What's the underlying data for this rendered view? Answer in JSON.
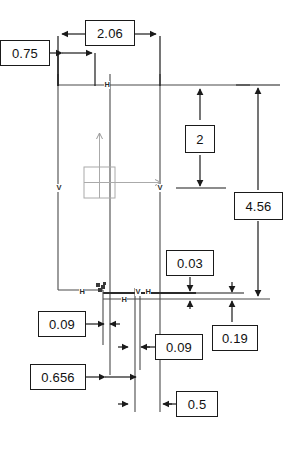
{
  "drawing": {
    "type": "cad-sketch-dimension-view",
    "background_color": "#ffffff",
    "line_color": "#3a3a3a",
    "dimension_line_color": "#1a1a1a",
    "box_border_color": "#1a1a1a",
    "origin_marker_color": "#9a9a9a"
  },
  "dimensions": [
    {
      "id": "d-075",
      "value": "0.75",
      "orientation": "horizontal",
      "box": {
        "x": 0,
        "y": 40,
        "w": 50,
        "h": 26
      }
    },
    {
      "id": "d-206",
      "value": "2.06",
      "orientation": "horizontal",
      "box": {
        "x": 85,
        "y": 20,
        "w": 50,
        "h": 26
      }
    },
    {
      "id": "d-2",
      "value": "2",
      "orientation": "vertical",
      "box": {
        "x": 185,
        "y": 125,
        "w": 30,
        "h": 28
      }
    },
    {
      "id": "d-456",
      "value": "4.56",
      "orientation": "vertical",
      "box": {
        "x": 234,
        "y": 192,
        "w": 49,
        "h": 28
      }
    },
    {
      "id": "d-003",
      "value": "0.03",
      "orientation": "vertical",
      "box": {
        "x": 166,
        "y": 250,
        "w": 48,
        "h": 26
      }
    },
    {
      "id": "d-019",
      "value": "0.19",
      "orientation": "vertical",
      "box": {
        "x": 212,
        "y": 325,
        "w": 46,
        "h": 26
      }
    },
    {
      "id": "d-009a",
      "value": "0.09",
      "orientation": "horizontal",
      "box": {
        "x": 38,
        "y": 311,
        "w": 48,
        "h": 26
      }
    },
    {
      "id": "d-009b",
      "value": "0.09",
      "orientation": "horizontal",
      "box": {
        "x": 155,
        "y": 334,
        "w": 48,
        "h": 26
      }
    },
    {
      "id": "d-0656",
      "value": "0.656",
      "orientation": "horizontal",
      "box": {
        "x": 30,
        "y": 364,
        "w": 56,
        "h": 26
      }
    },
    {
      "id": "d-05",
      "value": "0.5",
      "orientation": "horizontal",
      "box": {
        "x": 176,
        "y": 391,
        "w": 42,
        "h": 26
      }
    }
  ],
  "constraints": [
    {
      "id": "c-h-top",
      "glyph": "H",
      "x": 104,
      "y": 81
    },
    {
      "id": "c-v-left",
      "glyph": "V",
      "x": 56,
      "y": 184
    },
    {
      "id": "c-v-mid",
      "glyph": "V",
      "x": 157,
      "y": 184
    },
    {
      "id": "c-h-low-left",
      "glyph": "H",
      "x": 79,
      "y": 288
    },
    {
      "id": "c-h-low-mid",
      "glyph": "H",
      "x": 121,
      "y": 296
    },
    {
      "id": "c-v-low-a",
      "glyph": "V",
      "x": 135,
      "y": 288
    },
    {
      "id": "c-h-low-b",
      "glyph": "H",
      "x": 145,
      "y": 288
    },
    {
      "id": "c-cluster",
      "glyph": "",
      "x": 98,
      "y": 286
    }
  ],
  "origin_marker": {
    "id": "sketch-origin",
    "x": 84,
    "y": 167,
    "size": 31,
    "axis_up_to_y": 133,
    "axis_right_to_x": 160
  }
}
